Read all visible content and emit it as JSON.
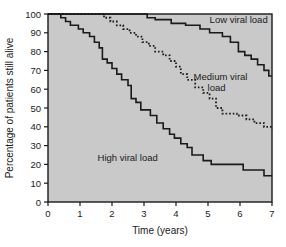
{
  "chart_data": {
    "type": "line",
    "title": "",
    "subtitle": "",
    "xlabel": "Time (years)",
    "ylabel": "Percentage of patients still alive",
    "xlim": [
      0,
      7
    ],
    "ylim": [
      0,
      100
    ],
    "grid": false,
    "legend_position": "inline-annotations",
    "plot_background": "#c9c9c9",
    "line_color": "#1a1a1a",
    "xticks": [
      "0",
      "1",
      "2",
      "3",
      "4",
      "5",
      "6",
      "7"
    ],
    "xtick_values": [
      0,
      1,
      2,
      3,
      4,
      5,
      6,
      7
    ],
    "yticks": [
      "0",
      "10",
      "20",
      "30",
      "40",
      "50",
      "60",
      "70",
      "80",
      "90",
      "100"
    ],
    "ytick_values": [
      0,
      10,
      20,
      30,
      40,
      50,
      60,
      70,
      80,
      90,
      100
    ],
    "series": [
      {
        "name": "Low viral load",
        "style": "solid",
        "label": "Low viral load",
        "label_x": 5.05,
        "label_y": 95,
        "points": [
          [
            0.0,
            100
          ],
          [
            3.1,
            100
          ],
          [
            3.1,
            98
          ],
          [
            3.35,
            98
          ],
          [
            3.35,
            97
          ],
          [
            3.85,
            97
          ],
          [
            3.85,
            95
          ],
          [
            4.3,
            95
          ],
          [
            4.3,
            94
          ],
          [
            4.75,
            94
          ],
          [
            4.75,
            92
          ],
          [
            5.05,
            92
          ],
          [
            5.05,
            90
          ],
          [
            5.45,
            90
          ],
          [
            5.45,
            88
          ],
          [
            5.7,
            88
          ],
          [
            5.7,
            85
          ],
          [
            5.95,
            85
          ],
          [
            5.95,
            80
          ],
          [
            6.15,
            80
          ],
          [
            6.15,
            78
          ],
          [
            6.35,
            78
          ],
          [
            6.35,
            76
          ],
          [
            6.55,
            76
          ],
          [
            6.55,
            73
          ],
          [
            6.75,
            73
          ],
          [
            6.75,
            70
          ],
          [
            6.9,
            70
          ],
          [
            6.9,
            67
          ],
          [
            7.0,
            67
          ]
        ]
      },
      {
        "name": "Medium viral load",
        "style": "dotted",
        "label": "Medium viral load",
        "label_line1": "Medium viral",
        "label_line2": "load",
        "label_x": 4.55,
        "label_y": 65,
        "points": [
          [
            0.0,
            100
          ],
          [
            1.75,
            100
          ],
          [
            1.75,
            98
          ],
          [
            1.95,
            98
          ],
          [
            1.95,
            96
          ],
          [
            2.15,
            96
          ],
          [
            2.15,
            94
          ],
          [
            2.35,
            94
          ],
          [
            2.35,
            92
          ],
          [
            2.55,
            92
          ],
          [
            2.55,
            90
          ],
          [
            2.75,
            90
          ],
          [
            2.75,
            88
          ],
          [
            2.95,
            88
          ],
          [
            2.95,
            85
          ],
          [
            3.15,
            85
          ],
          [
            3.15,
            83
          ],
          [
            3.35,
            83
          ],
          [
            3.35,
            80
          ],
          [
            3.6,
            80
          ],
          [
            3.6,
            78
          ],
          [
            3.8,
            78
          ],
          [
            3.8,
            75
          ],
          [
            4.0,
            75
          ],
          [
            4.0,
            72
          ],
          [
            4.15,
            72
          ],
          [
            4.15,
            68
          ],
          [
            4.35,
            68
          ],
          [
            4.35,
            65
          ],
          [
            4.6,
            65
          ],
          [
            4.6,
            61
          ],
          [
            4.85,
            61
          ],
          [
            4.85,
            58
          ],
          [
            5.05,
            58
          ],
          [
            5.05,
            55
          ],
          [
            5.25,
            55
          ],
          [
            5.25,
            50
          ],
          [
            5.45,
            50
          ],
          [
            5.45,
            47
          ],
          [
            5.9,
            47
          ],
          [
            5.9,
            46
          ],
          [
            6.2,
            46
          ],
          [
            6.2,
            44
          ],
          [
            6.45,
            44
          ],
          [
            6.45,
            42
          ],
          [
            6.75,
            42
          ],
          [
            6.75,
            40
          ],
          [
            7.0,
            40
          ],
          [
            7.0,
            39
          ]
        ]
      },
      {
        "name": "High viral load",
        "style": "solid",
        "label": "High viral load",
        "label_x": 1.55,
        "label_y": 22,
        "points": [
          [
            0.0,
            100
          ],
          [
            0.4,
            100
          ],
          [
            0.4,
            98
          ],
          [
            0.55,
            98
          ],
          [
            0.55,
            96
          ],
          [
            0.7,
            96
          ],
          [
            0.7,
            94
          ],
          [
            0.95,
            94
          ],
          [
            0.95,
            92
          ],
          [
            1.1,
            92
          ],
          [
            1.1,
            90
          ],
          [
            1.3,
            90
          ],
          [
            1.3,
            88
          ],
          [
            1.45,
            88
          ],
          [
            1.45,
            85
          ],
          [
            1.6,
            85
          ],
          [
            1.6,
            82
          ],
          [
            1.7,
            82
          ],
          [
            1.7,
            76
          ],
          [
            1.85,
            76
          ],
          [
            1.85,
            74
          ],
          [
            2.0,
            74
          ],
          [
            2.0,
            71
          ],
          [
            2.15,
            71
          ],
          [
            2.15,
            68
          ],
          [
            2.3,
            68
          ],
          [
            2.3,
            65
          ],
          [
            2.5,
            65
          ],
          [
            2.5,
            62
          ],
          [
            2.6,
            62
          ],
          [
            2.6,
            55
          ],
          [
            2.75,
            55
          ],
          [
            2.75,
            53
          ],
          [
            2.9,
            53
          ],
          [
            2.9,
            49
          ],
          [
            3.2,
            49
          ],
          [
            3.2,
            46
          ],
          [
            3.4,
            46
          ],
          [
            3.4,
            42
          ],
          [
            3.6,
            42
          ],
          [
            3.6,
            39
          ],
          [
            3.8,
            39
          ],
          [
            3.8,
            36
          ],
          [
            3.95,
            36
          ],
          [
            3.95,
            34
          ],
          [
            4.15,
            34
          ],
          [
            4.15,
            31
          ],
          [
            4.35,
            31
          ],
          [
            4.35,
            29
          ],
          [
            4.5,
            29
          ],
          [
            4.5,
            25
          ],
          [
            4.85,
            25
          ],
          [
            4.85,
            22
          ],
          [
            5.1,
            22
          ],
          [
            5.1,
            20
          ],
          [
            6.1,
            20
          ],
          [
            6.1,
            17
          ],
          [
            6.75,
            17
          ],
          [
            6.75,
            14
          ],
          [
            7.0,
            14
          ]
        ]
      }
    ]
  }
}
